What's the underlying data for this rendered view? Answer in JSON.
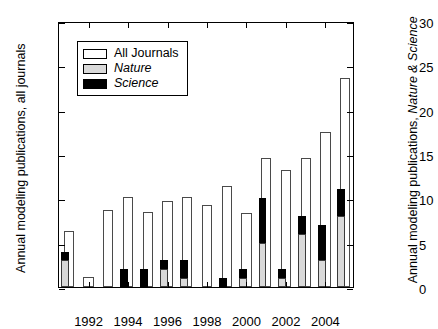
{
  "chart_data": {
    "type": "bar",
    "title": "",
    "xlabel": "",
    "ylabel": "Annual modeling publications, all journals",
    "ylabel_right": "Annual modeling publications, Nature & Science",
    "ylabel_right_plain": "Annual modeling publications, ",
    "ylabel_right_italic": "Nature & Science",
    "categories": [
      1991,
      1992,
      1993,
      1994,
      1995,
      1996,
      1997,
      1998,
      1999,
      2000,
      2001,
      2002,
      2003,
      2004,
      2005
    ],
    "x_tick_labels": [
      "1992",
      "1994",
      "1996",
      "1998",
      "2000",
      "2002",
      "2004"
    ],
    "x_tick_values": [
      1992,
      1994,
      1996,
      1998,
      2000,
      2002,
      2004
    ],
    "ylim": [
      0,
      300
    ],
    "y_ticks": [
      0,
      50,
      100,
      150,
      200,
      250,
      300
    ],
    "ylim_right": [
      0,
      30
    ],
    "y_ticks_right": [
      0,
      5,
      10,
      15,
      20,
      25,
      30
    ],
    "grid": false,
    "legend_position": "upper left",
    "series": [
      {
        "name": "All Journals",
        "axis": "left",
        "color": "#ffffff",
        "values": [
          63,
          11,
          87,
          102,
          85,
          97,
          101,
          92,
          114,
          84,
          145,
          132,
          145,
          175,
          236
        ]
      },
      {
        "name": "Nature",
        "axis": "right",
        "color": "#d9d9d9",
        "values": [
          3.1,
          0,
          0,
          0,
          0,
          2,
          1,
          0,
          0,
          1,
          5,
          1,
          6,
          3,
          8
        ]
      },
      {
        "name": "Science",
        "axis": "right",
        "color": "#000000",
        "values": [
          0.9,
          0,
          0,
          2,
          2,
          1,
          2,
          0,
          1,
          1,
          5,
          1,
          2,
          4,
          3
        ]
      }
    ],
    "ns_totals": [
      4,
      0,
      0,
      2,
      2,
      3,
      3,
      0,
      1,
      2,
      10,
      2,
      8,
      7,
      11
    ]
  },
  "legend": {
    "items": [
      {
        "label": "All Journals",
        "swatch": "sw-all",
        "italic": false
      },
      {
        "label": "Nature",
        "swatch": "sw-nat",
        "italic": true
      },
      {
        "label": "Science",
        "swatch": "sw-sci",
        "italic": true
      }
    ]
  }
}
